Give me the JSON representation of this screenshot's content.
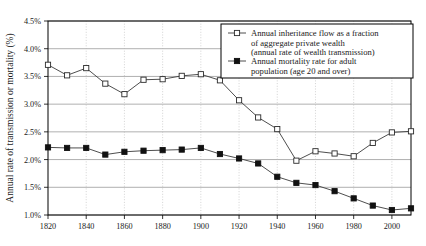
{
  "chart_data": {
    "type": "line",
    "title": "",
    "xlabel": "",
    "ylabel": "Annual rate of transmission or mortality (%)",
    "xlim": [
      1820,
      2010
    ],
    "ylim": [
      1.0,
      4.5
    ],
    "ytick_labels": [
      "1.0%",
      "1.5%",
      "2.0%",
      "2.5%",
      "3.0%",
      "3.5%",
      "4.0%",
      "4.5%"
    ],
    "ytick_values": [
      1.0,
      1.5,
      2.0,
      2.5,
      3.0,
      3.5,
      4.0,
      4.5
    ],
    "xtick_labels": [
      "1820",
      "1840",
      "1860",
      "1880",
      "1900",
      "1920",
      "1940",
      "1960",
      "1980",
      "2000"
    ],
    "xtick_values": [
      1820,
      1840,
      1860,
      1880,
      1900,
      1920,
      1940,
      1960,
      1980,
      2000
    ],
    "grid": "horizontal-solid-and-vertical-dotted",
    "legend_position": "top-right",
    "x": [
      1820,
      1830,
      1840,
      1850,
      1860,
      1870,
      1880,
      1890,
      1900,
      1910,
      1920,
      1930,
      1940,
      1950,
      1960,
      1970,
      1980,
      1990,
      2000,
      2010
    ],
    "series": [
      {
        "name": "Annual inheritance flow as a fraction of aggregate private wealth (annual rate of wealth transmission)",
        "legend_line1": "Annual inheritance flow as a fraction",
        "legend_line2": "of aggregate private wealth",
        "legend_line3": "(annual rate of wealth transmission)",
        "marker": "open-square",
        "values": [
          3.71,
          3.52,
          3.65,
          3.37,
          3.18,
          3.44,
          3.45,
          3.51,
          3.54,
          3.43,
          3.07,
          2.76,
          2.55,
          1.98,
          2.15,
          2.11,
          2.06,
          2.3,
          2.49,
          2.51
        ]
      },
      {
        "name": "Annual mortality rate for adult population (age 20 and over)",
        "legend_line1": "Annual mortality rate for adult",
        "legend_line2": "population (age 20 and over)",
        "marker": "filled-square",
        "values": [
          2.22,
          2.21,
          2.21,
          2.09,
          2.14,
          2.16,
          2.17,
          2.18,
          2.21,
          2.1,
          2.02,
          1.93,
          1.69,
          1.58,
          1.54,
          1.43,
          1.3,
          1.17,
          1.09,
          1.12
        ]
      }
    ]
  }
}
